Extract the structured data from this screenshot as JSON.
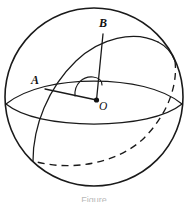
{
  "figure": {
    "type": "geometry-diagram",
    "background_color": "#ffffff",
    "stroke_color": "#1a1a1a",
    "width": 188,
    "height": 202,
    "labels": {
      "point_a": "A",
      "point_b": "B",
      "center_o": "O"
    },
    "caption": "Figure",
    "elements": [
      {
        "name": "sphere-outline",
        "kind": "circle",
        "cx": 94,
        "cy": 97,
        "r": 89,
        "style": "solid"
      },
      {
        "name": "equator-ellipse-front",
        "kind": "ellipse-arc",
        "style": "solid"
      },
      {
        "name": "equator-ellipse-back",
        "kind": "ellipse-arc",
        "style": "solid"
      },
      {
        "name": "great-circle-front",
        "kind": "ellipse-arc",
        "style": "solid"
      },
      {
        "name": "great-circle-back",
        "kind": "ellipse-arc",
        "style": "dashed"
      },
      {
        "name": "radius-oa",
        "kind": "segment",
        "from": "O",
        "to": "A",
        "style": "solid"
      },
      {
        "name": "radius-ob",
        "kind": "segment",
        "from": "O",
        "to": "B",
        "style": "solid"
      },
      {
        "name": "central-angle-arc",
        "kind": "arc",
        "between": "OA and OB",
        "style": "solid"
      }
    ],
    "points": {
      "A": {
        "x": 44,
        "y": 89
      },
      "B": {
        "x": 103,
        "y": 33
      },
      "O": {
        "x": 97,
        "y": 100
      }
    }
  }
}
